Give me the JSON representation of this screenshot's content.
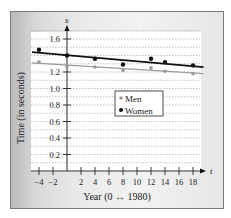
{
  "chart_data": {
    "type": "scatter",
    "title": "",
    "xlabel": "Year (0 ↔ 1980)",
    "ylabel": "Time (in seconds)",
    "x_axis_var": "t",
    "y_axis_var": "s",
    "xlim": [
      -5,
      19.5
    ],
    "ylim": [
      0,
      1.75
    ],
    "x_ticks": [
      -4,
      -2,
      2,
      4,
      6,
      8,
      10,
      12,
      14,
      16,
      18
    ],
    "x_tick_labels": [
      "−4",
      "−2",
      "2",
      "4",
      "6",
      "8",
      "10",
      "12",
      "14",
      "16",
      "18"
    ],
    "y_ticks": [
      0.2,
      0.4,
      0.6,
      0.8,
      1.0,
      1.2,
      1.4,
      1.6
    ],
    "y_tick_labels": [
      "0.2",
      "0.4",
      "0.6",
      "0.8",
      "1.0",
      "1.2",
      "",
      "1.6"
    ],
    "grid": "dashed horizontal",
    "legend_position": "center-right inside plot",
    "x": [
      -4,
      0,
      4,
      8,
      12,
      14,
      18
    ],
    "series": [
      {
        "name": "Men",
        "color": "#9a9a9a",
        "values": [
          1.32,
          1.27,
          1.26,
          1.22,
          1.25,
          1.21,
          1.18
        ],
        "trendline": {
          "x": [
            -5,
            19.5
          ],
          "y": [
            1.31,
            1.18
          ]
        }
      },
      {
        "name": "Women",
        "color": "#111111",
        "values": [
          1.47,
          1.4,
          1.36,
          1.29,
          1.36,
          1.32,
          1.28
        ],
        "trendline": {
          "x": [
            -5,
            19.5
          ],
          "y": [
            1.44,
            1.26
          ]
        }
      }
    ]
  },
  "legend": {
    "men": "Men",
    "women": "Women"
  },
  "axes": {
    "xlabel": "Year (0 ↔ 1980)",
    "ylabel": "Time (in seconds)",
    "x_var": "t",
    "y_var": "s"
  }
}
